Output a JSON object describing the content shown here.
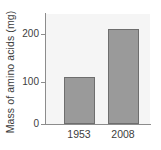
{
  "chart_data": {
    "type": "bar",
    "title": "",
    "xlabel": "",
    "ylabel": "Mass of amino acids (mg)",
    "categories": [
      "1953",
      "2008"
    ],
    "values": [
      105,
      212
    ],
    "ylim": [
      0,
      245
    ],
    "yticks": [
      "0",
      "100",
      "200"
    ],
    "ytick_values": [
      0,
      100,
      200
    ],
    "grid": false,
    "legend": "none",
    "series": [
      {
        "name": "Mass of amino acids (mg)",
        "values": [
          105,
          212
        ]
      }
    ]
  },
  "style": {
    "bar_fill": "#9a9a9a",
    "bar_stroke": "#6e6e6e",
    "plot_background": "#f5f5f5",
    "axis_color": "#8c8c8c",
    "text_color": "#3d3d3d",
    "page_background": "#ffffff"
  }
}
